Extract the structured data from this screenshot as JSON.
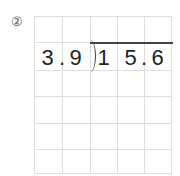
{
  "problem": {
    "label": "②",
    "divisor": [
      "3",
      ".",
      "9"
    ],
    "dividend": [
      "1",
      "5",
      ".",
      "6"
    ]
  },
  "grid": {
    "columns": 5,
    "rows": 6
  }
}
